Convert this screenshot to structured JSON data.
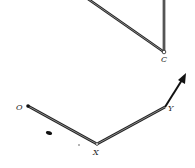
{
  "diagram": {
    "type": "linkage",
    "colors": {
      "bar": "#555555",
      "bar_edge": "#222222",
      "arrow": "#111111",
      "label": "#222222"
    },
    "upper_mechanism": {
      "joint_label": "C"
    },
    "lower_mechanism": {
      "labels": {
        "o": "O",
        "x": "X",
        "y": "Y"
      },
      "arrow": "direction-arrow-at-Y"
    }
  }
}
